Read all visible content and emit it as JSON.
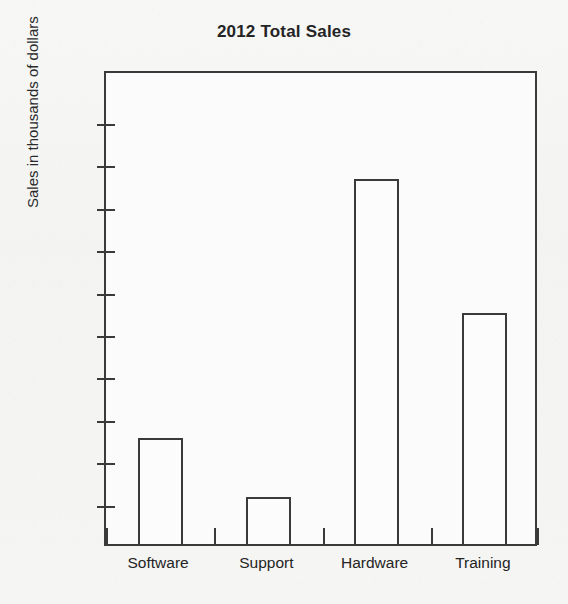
{
  "document": {
    "bleed_through_text": "sanos pagelo qui anso subserv\nac l quarcus in enomarla\nle ropperno ater can m en\nre valine in the Table"
  },
  "chart_data": {
    "type": "bar",
    "title": "2012 Total Sales",
    "xlabel": "",
    "ylabel": "Sales in thousands of dollars",
    "categories": [
      "Software",
      "Support",
      "Hardware",
      "Training"
    ],
    "values": [
      25,
      11,
      86,
      54.5
    ],
    "ylim": [
      0,
      112
    ],
    "yticks": [
      10,
      20,
      30,
      40,
      50,
      60,
      70,
      80,
      90,
      100
    ],
    "ytick_labels": [
      "10",
      "20",
      "30",
      "40",
      "50",
      "60",
      "70",
      "80",
      "90",
      "100"
    ],
    "grid": false,
    "legend": "none",
    "series": [
      {
        "name": "2012 Total Sales",
        "values": [
          25,
          11,
          86,
          54.5
        ]
      }
    ],
    "bar_style": {
      "fill": "#fcfcfc",
      "edge": "#3a3a3a"
    }
  }
}
